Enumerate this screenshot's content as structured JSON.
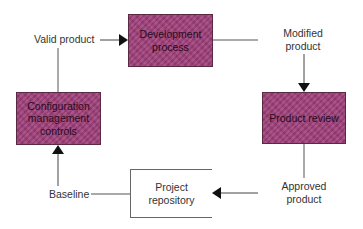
{
  "diagram": {
    "type": "cycle-flowchart",
    "nodes": {
      "development": {
        "label_line1": "Development",
        "label_line2": "process",
        "style": "filled"
      },
      "review": {
        "label": "Product review",
        "style": "filled"
      },
      "repository": {
        "label_line1": "Project",
        "label_line2": "repository",
        "style": "open-box"
      },
      "config": {
        "label_line1": "Configuration",
        "label_line2": "management",
        "label_line3": "controls",
        "style": "filled"
      }
    },
    "edge_labels": {
      "valid_product": "Valid product",
      "modified_product_line1": "Modified",
      "modified_product_line2": "product",
      "approved_product_line1": "Approved",
      "approved_product_line2": "product",
      "baseline": "Baseline"
    },
    "edges": [
      {
        "from": "config",
        "to": "development",
        "label": "Valid product"
      },
      {
        "from": "development",
        "to": "review",
        "label": "Modified product"
      },
      {
        "from": "review",
        "to": "repository",
        "label": "Approved product"
      },
      {
        "from": "repository",
        "to": "config",
        "label": "Baseline"
      }
    ],
    "colors": {
      "box_fill": "#9c3f78",
      "box_border": "#5a2a44",
      "line": "#444444",
      "arrowhead": "#111111"
    }
  }
}
